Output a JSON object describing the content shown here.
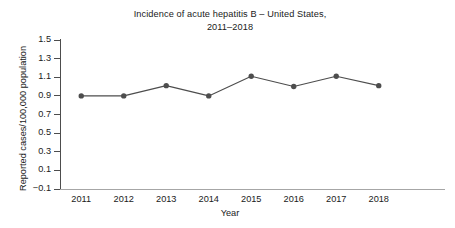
{
  "chart_data": {
    "type": "line",
    "title": "Incidence of acute hepatitis B – United States, 2011–2018",
    "title_lines": [
      "Incidence of acute hepatitis B – United States,",
      "2011–2018"
    ],
    "xlabel": "Year",
    "ylabel": "Reported cases/100,000 population",
    "categories": [
      "2011",
      "2012",
      "2013",
      "2014",
      "2015",
      "2016",
      "2017",
      "2018"
    ],
    "x": [
      2011,
      2012,
      2013,
      2014,
      2015,
      2016,
      2017,
      2018
    ],
    "values": [
      0.9,
      0.9,
      1.01,
      0.9,
      1.11,
      1.0,
      1.11,
      1.01
    ],
    "series": [
      {
        "name": "Acute hepatitis B incidence",
        "values": [
          0.9,
          0.9,
          1.01,
          0.9,
          1.11,
          1.0,
          1.11,
          1.01
        ]
      }
    ],
    "ylim": [
      -0.1,
      1.5
    ],
    "yticks": [
      1.5,
      1.3,
      1.1,
      0.9,
      0.7,
      0.5,
      0.3,
      0.1,
      -0.1
    ],
    "ytick_labels": [
      "1.5",
      "1.3",
      "1.1",
      "0.9",
      "0.7",
      "0.5",
      "0.3",
      "0.1",
      "−0.1"
    ],
    "xlim": [
      2010.5,
      2018.5
    ],
    "grid": false,
    "legend": null,
    "legend_position": "none",
    "marker": "circle",
    "line_color": "#4d4d4d",
    "marker_color": "#4d4d4d",
    "axis_color": "#4d4d4d",
    "background_color": "#ffffff",
    "text_color": "#1a1a1a"
  }
}
